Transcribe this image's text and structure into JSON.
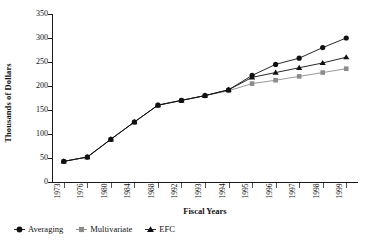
{
  "chart_data": {
    "type": "line",
    "title": "",
    "xlabel": "Fiscal Years",
    "ylabel": "Thousands of Dollars",
    "categories": [
      "1973",
      "1976",
      "1980",
      "1984",
      "1988",
      "1992",
      "1993",
      "1994",
      "1995",
      "1996",
      "1997",
      "1998",
      "1999"
    ],
    "xlim_categories": 13,
    "ylim": [
      0,
      350
    ],
    "yticks": [
      0,
      50,
      100,
      150,
      200,
      250,
      300,
      350
    ],
    "grid": false,
    "legend_position": "bottom-left",
    "series": [
      {
        "name": "Averaging",
        "marker": "circle",
        "color": "#111111",
        "values": [
          43,
          52,
          89,
          125,
          160,
          170,
          180,
          192,
          222,
          245,
          258,
          280,
          300
        ]
      },
      {
        "name": "Multivariate",
        "marker": "square",
        "color": "#8c8c8c",
        "values": [
          43,
          52,
          89,
          125,
          160,
          170,
          180,
          190,
          205,
          212,
          220,
          228,
          236
        ]
      },
      {
        "name": "EFC",
        "marker": "triangle",
        "color": "#111111",
        "values": [
          43,
          52,
          89,
          125,
          160,
          170,
          180,
          192,
          218,
          228,
          238,
          248,
          260
        ]
      }
    ]
  },
  "legend": {
    "entries": [
      {
        "label": "Averaging",
        "marker": "circle-marker-icon"
      },
      {
        "label": "Multivariate",
        "marker": "square-marker-icon"
      },
      {
        "label": "EFC",
        "marker": "triangle-marker-icon"
      }
    ]
  },
  "axes": {
    "y_title": "Thousands of Dollars",
    "x_title": "Fiscal Years",
    "y_labels": [
      "350",
      "300",
      "250",
      "200",
      "150",
      "100",
      "50",
      "0"
    ],
    "x_labels": [
      "1973",
      "1976",
      "1980",
      "1984",
      "1988",
      "1992",
      "1993",
      "1994",
      "1995",
      "1996",
      "1997",
      "1998",
      "1999"
    ]
  }
}
